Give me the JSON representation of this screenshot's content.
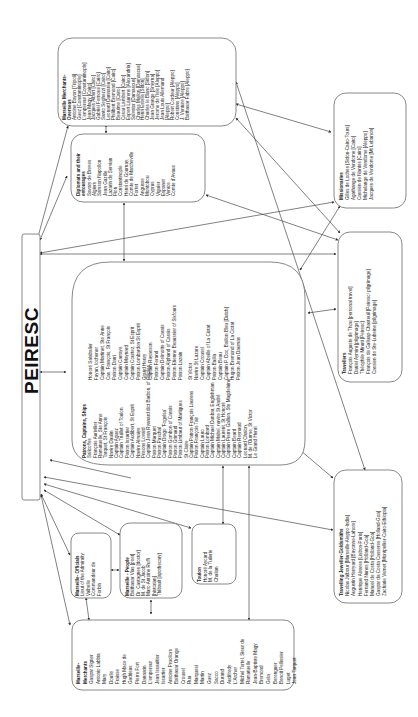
{
  "diagram": {
    "center": {
      "label": "PEIRESC"
    },
    "nodes": [
      {
        "id": "marseille-merchants-overseas",
        "title": [
          "Marseille Merchants-",
          "Overseas"
        ],
        "items": [
          "Antoine Bayon [Tripoli]",
          "Guez [Constantinople]",
          "L'empereur [Constantinople]",
          "Jean Magy [Cairo]",
          "Jacques Albert [Cairo]",
          "Gabriel Fernoux [Cairo]",
          "Santo Seghezzi [Cairo]",
          "Leonard Dannareu [Cairo]",
          "Philibert Bremond [Cairo]",
          "Beaulme [Cairo]",
          "Cesar Lambert [Cairo]",
          "Espert Laurens [Alexandria]",
          "Salvator [Damascus]",
          "Charles Mallon [Damascus]",
          "Henri Estelle [Sidon]",
          "Charles le Blanc [Sidon]",
          "Jean Grange [Smyrna]",
          "Jerome de l'Isle [Aleppo]",
          "Jean Louis Allemand",
          "[Aleppo]",
          "Robert Cordeur [Aleppo]",
          "Constans [Aleppo]",
          "J. Venture [Aleppo]",
          "Balthasar Fabre [Aleppo]"
        ]
      },
      {
        "id": "diplomats",
        "title": [
          "Diplomats and their",
          "entourages"
        ],
        "items": [
          "Savary de Breves",
          "Algiers",
          "Samson Napollon",
          "Jean Gazille",
          "Lazarin de Servian",
          "Pion",
          "Constantinople",
          "Henri de Gournay,",
          "Comte de Marcheville",
          "Fortet",
          "Angusse",
          "Montobou",
          "Cyprus",
          "Viguier",
          "Espanet",
          "Venice",
          "Comte d'Avaux"
        ]
      },
      {
        "id": "missionaries",
        "title": [
          "Missionaries"
        ],
        "items": [
          "Gilles de Loches [Sidon-Cairo-Tours]",
          "Agathange de Vendome [Cairo]",
          "Cassien de Nantes [Cairo]",
          "Michelange de Vendome [Aleppo]",
          "Jacques de Vendome [Mt Lebanon]"
        ]
      },
      {
        "id": "travellers",
        "title": [
          "Travellers"
        ],
        "items": [
          "François Auguste de Thou [personal travel]",
          "Daniel Aymini [pilgrimage]",
          "Théophile Minuti [Peiresc]",
          "François de Galluap-Chasteuil [Peiresc/ pilgrimage]",
          "Cassien de Ste-Lubeine [pilgrimage]"
        ]
      },
      {
        "id": "patrons-captains-ships",
        "title": [
          "Patrons, Captains, Ships"
        ],
        "columns": [
          [
            "Salicoffes",
            "François Aurivilier",
            "Ramatuelle, Ste Anne",
            "Tarquet, St François",
            "Navire Daulin",
            "Captain Aguez",
            "Captain Truillet of Toulon",
            "Patron Issartier",
            "Captain Audibert, St Esprit",
            "Navire Almaiye",
            "Prisons Lovard",
            "Captain Jean Ryanard dict Barbon, of Ollioles",
            "Patron Marquet",
            "Patron Paschal",
            "Captain Drago 'Fogelsa'",
            "Patron Gombon of Cassis",
            "Patron Grimaud",
            "Patron Limbaut of Martigues",
            "St Claire",
            "Captain Patron François Laurens",
            "Patron François Tair",
            "Captain Lauro",
            "Patron Lombard",
            "Captain Michael Dunbar, Englishman",
            "Captain Mabel, navire St André",
            "Captain Laurent, St Honoré",
            "Captain Pierre Gallion, Ste Magdelaine",
            "Captain Beard",
            "Captain Reynaud",
            "Leonard Chalon,",
            "M. de l'Ourme, St Victor",
            "Le Grand Henri"
          ],
          [
            "Honoré Salabalier",
            "Fayan, lochener",
            "Captain Martinet, Ste Anne",
            "Cas. François, St François",
            "Patron Darri",
            "Captain Carraye",
            "Captain Maynard",
            "Captain Courtez, St Esprit",
            "Patron Lombardon St Esprit",
            "Grand Henry",
            "Captain Rayasson",
            "Patron Ferand",
            "Captain Delmotte of Cassis",
            "Patron Alphand of Cassis",
            "Patron Etienne Beaussier of Sixfours",
            "Patron Lazain",
            "St Victor",
            "Navire St Lazare",
            "Captain Crousel",
            "Captain Abeille of La Ciotat",
            "Patron Bailla",
            "Captain Beau",
            "Captain P. Doc, Baillon Bleu [Dutch]",
            "Hugon Bremond of La Ciotat",
            "Patron Jean Daumas"
          ]
        ]
      },
      {
        "id": "marseille-officials",
        "title": [
          "Marseille- Officials"
        ],
        "items": [
          "Lieut of the Admiralty",
          "Valbelle",
          "Commandeur de",
          "Forbin"
        ]
      },
      {
        "id": "marseille-people",
        "title": [
          "Marseille - People"
        ],
        "items": [
          "Balthasar Vias [poet]",
          "Dr. Castagnes [doctor]",
          "M. de St Jacob",
          "Marc-Antoine Ruffi",
          "[historian]",
          "Thibault [apothecary]"
        ]
      },
      {
        "id": "toulon",
        "title": [
          "Toulon"
        ],
        "items": [
          "Honoré Aycard",
          "M. de la Tuilerie",
          "Chalian"
        ]
      },
      {
        "id": "travelling-jeweller-goldsmiths",
        "title": [
          "Travelling Jeweller-Goldsmiths"
        ],
        "items": [
          "Nicolas Jalbour [Marseille-Aleppo-India]",
          "Augustin Herryard [Bayonne-Lahore]",
          "Henrique Alvares [Lisbon-Paris]",
          "Fernand Nunes [Holland-Goa]",
          "Manuel de Costa [Holland-Goa]",
          "Gaspar da Costa Casseres [Holland-Goa]",
          "Zacharie Vernet [Montpellier-Cairo-Ethiopia]"
        ]
      },
      {
        "id": "marseille-merchants",
        "title": [
          "Marseille-",
          "Merchants"
        ],
        "items": [
          "Gaspar Signer",
          "Antonio Labbia",
          "Mary",
          "Doulle",
          "Fraisse",
          "Hugh Mace de",
          "Gadrieas",
          "Pierre Fort",
          "Dannarin",
          "L'empereur",
          "Jean Issaultier",
          "Issartier",
          "Antoine Pruollors",
          "Balthasar Orange",
          "Crousel",
          "Rua",
          "Marquesi",
          "Martin",
          "Guez",
          "Sacco",
          "Durand",
          "Audifredy",
          "L'Archer",
          "Michel Tortel, Sieur de",
          "Ramatuelle",
          "Jean-Baptiste Magy",
          "Bremond",
          "Gela",
          "Berenguer",
          "Benoit Pellissier",
          "Luget",
          "Jean Tarquet"
        ]
      }
    ]
  },
  "colors": {
    "box_stroke": "#7a7a7a",
    "edge": "#4a4a4a",
    "text": "#222222",
    "background": "#ffffff"
  }
}
